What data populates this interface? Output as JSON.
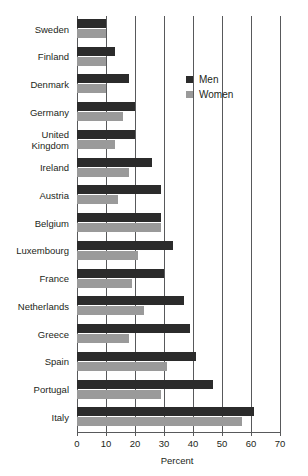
{
  "chart_data": {
    "type": "bar",
    "orientation": "horizontal",
    "title": "",
    "xlabel": "Percent",
    "ylabel": "",
    "xlim": [
      0,
      70
    ],
    "xticks": [
      0,
      10,
      20,
      30,
      40,
      50,
      60,
      70
    ],
    "xtick_labels": [
      "0",
      "10",
      "20",
      "30",
      "40",
      "50",
      "60",
      "70"
    ],
    "grid": true,
    "grid_axis": "x",
    "legend_position": "upper-right-inside",
    "categories": [
      "Sweden",
      "Finland",
      "Denmark",
      "Germany",
      "United\nKingdom",
      "Ireland",
      "Austria",
      "Belgium",
      "Luxembourg",
      "France",
      "Netherlands",
      "Greece",
      "Spain",
      "Portugal",
      "Italy"
    ],
    "series": [
      {
        "name": "Men",
        "color": "#2b2b2b",
        "values": [
          10,
          13,
          18,
          20,
          20,
          26,
          29,
          29,
          33,
          30,
          37,
          39,
          41,
          47,
          61
        ]
      },
      {
        "name": "Women",
        "color": "#9a9a9a",
        "values": [
          10,
          10,
          10,
          16,
          13,
          18,
          14,
          29,
          21,
          19,
          23,
          18,
          31,
          29,
          57
        ]
      }
    ]
  },
  "legend": {
    "items": [
      {
        "label": "Men",
        "color": "#2b2b2b"
      },
      {
        "label": "Women",
        "color": "#9a9a9a"
      }
    ]
  },
  "axis": {
    "x_title": "Percent"
  },
  "colors": {
    "men": "#2b2b2b",
    "women": "#9a9a9a",
    "grid": "#58595b",
    "text": "#231f20",
    "background": "#ffffff"
  }
}
